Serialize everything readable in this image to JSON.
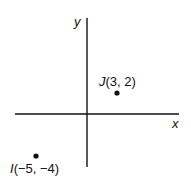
{
  "axes": {
    "x_label": "x",
    "y_label": "y"
  },
  "points": [
    {
      "name": "J",
      "coords": "(3, 2)",
      "x": 3,
      "y": 2
    },
    {
      "name": "I",
      "coords": "(−5, −4)",
      "x": -5,
      "y": -4
    }
  ],
  "colors": {
    "line": "#111111",
    "background": "#ffffff"
  }
}
